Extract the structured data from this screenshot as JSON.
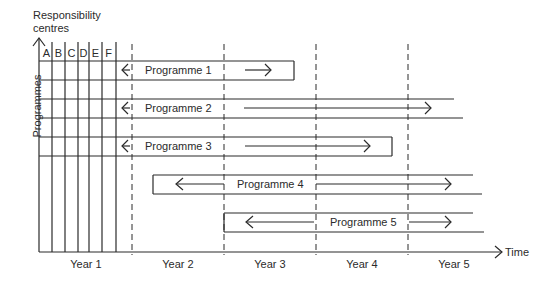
{
  "diagram": {
    "y_axis_title_line1": "Responsibility",
    "y_axis_title_line2": "centres",
    "row_axis_label": "Programmes",
    "x_axis_label": "Time",
    "responsibility_centres": [
      "A",
      "B",
      "C",
      "D",
      "E",
      "F"
    ],
    "years": [
      "Year 1",
      "Year 2",
      "Year 3",
      "Year 4",
      "Year 5"
    ],
    "programmes": [
      {
        "label": "Programme 1",
        "start_x": 39,
        "end_x": 294,
        "top": 61,
        "bottom": 80,
        "closed_right": true
      },
      {
        "label": "Programme 2",
        "start_x": 39,
        "end_x": 463,
        "top": 99,
        "bottom": 118,
        "closed_right": false
      },
      {
        "label": "Programme 3",
        "start_x": 39,
        "end_x": 392,
        "top": 137,
        "bottom": 156,
        "closed_right": true
      },
      {
        "label": "Programme 4",
        "start_x": 153,
        "end_x": 482,
        "top": 175,
        "bottom": 194,
        "closed_right": false
      },
      {
        "label": "Programme 5",
        "start_x": 224,
        "end_x": 484,
        "top": 213,
        "bottom": 232,
        "closed_right": false
      }
    ]
  }
}
